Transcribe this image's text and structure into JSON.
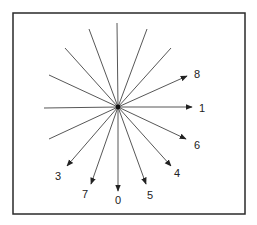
{
  "diagram": {
    "type": "radial-direction-diagram",
    "frame": {
      "x": 13,
      "y": 13,
      "width": 232,
      "height": 201
    },
    "center": {
      "x": 118,
      "y": 107
    },
    "colors": {
      "line": "#444444",
      "frame": "#2a2a2a",
      "text": "#222222",
      "background": "#ffffff"
    },
    "plain_rays": [
      {
        "x": 117,
        "y": 23
      },
      {
        "x": 89,
        "y": 29
      },
      {
        "x": 147,
        "y": 29
      },
      {
        "x": 65,
        "y": 48
      },
      {
        "x": 171,
        "y": 48
      },
      {
        "x": 49,
        "y": 75
      },
      {
        "x": 44,
        "y": 108
      },
      {
        "x": 49,
        "y": 139
      }
    ],
    "arrows": [
      {
        "label": "8",
        "tip": {
          "x": 187,
          "y": 76
        },
        "label_pos": {
          "x": 194,
          "y": 78
        }
      },
      {
        "label": "1",
        "tip": {
          "x": 192,
          "y": 107
        },
        "label_pos": {
          "x": 199,
          "y": 112
        }
      },
      {
        "label": "6",
        "tip": {
          "x": 186,
          "y": 139
        },
        "label_pos": {
          "x": 194,
          "y": 149
        }
      },
      {
        "label": "4",
        "tip": {
          "x": 171,
          "y": 166
        },
        "label_pos": {
          "x": 174,
          "y": 177
        }
      },
      {
        "label": "5",
        "tip": {
          "x": 146,
          "y": 184
        },
        "label_pos": {
          "x": 147,
          "y": 199
        }
      },
      {
        "label": "0",
        "tip": {
          "x": 118,
          "y": 191
        },
        "label_pos": {
          "x": 115,
          "y": 204
        }
      },
      {
        "label": "7",
        "tip": {
          "x": 91,
          "y": 184
        },
        "label_pos": {
          "x": 82,
          "y": 198
        }
      },
      {
        "label": "3",
        "tip": {
          "x": 67,
          "y": 166
        },
        "label_pos": {
          "x": 55,
          "y": 180
        }
      }
    ]
  }
}
